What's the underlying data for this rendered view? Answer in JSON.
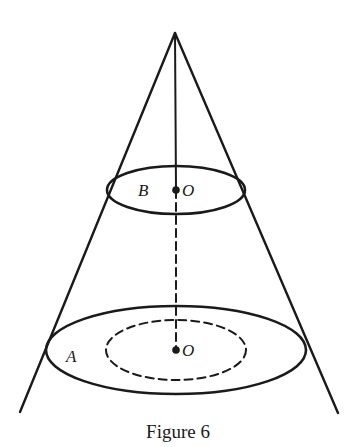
{
  "figure": {
    "caption": "Figure 6",
    "labels": {
      "top_ellipse_label": "B",
      "top_center_label": "O",
      "bottom_ellipse_label": "A",
      "bottom_center_label": "O"
    },
    "elements": [
      {
        "type": "cone",
        "apex": [
          175,
          33
        ],
        "base_left": [
          20,
          412
        ],
        "base_right": [
          338,
          413
        ]
      },
      {
        "type": "ellipse",
        "name": "top-cross-section",
        "label": "B",
        "center": [
          176,
          190
        ],
        "rx": 69,
        "ry": 24,
        "style": "solid"
      },
      {
        "type": "ellipse",
        "name": "base-cross-section",
        "label": "A",
        "center": [
          176,
          350
        ],
        "rx": 130,
        "ry": 44,
        "style": "solid"
      },
      {
        "type": "ellipse",
        "name": "inner-dashed-ellipse",
        "center": [
          176,
          350
        ],
        "rx": 70,
        "ry": 30,
        "style": "dashed"
      },
      {
        "type": "line",
        "name": "axis-solid",
        "from": [
          175,
          33
        ],
        "to": [
          176,
          190
        ],
        "style": "solid"
      },
      {
        "type": "line",
        "name": "axis-dashed",
        "from": [
          176,
          190
        ],
        "to": [
          176,
          350
        ],
        "style": "dashed"
      },
      {
        "type": "point",
        "name": "center-top",
        "label": "O",
        "at": [
          176,
          190
        ]
      },
      {
        "type": "point",
        "name": "center-bottom",
        "label": "O",
        "at": [
          176,
          350
        ]
      }
    ],
    "colors": {
      "stroke": "#1a1a1a",
      "background": "#ffffff"
    }
  }
}
